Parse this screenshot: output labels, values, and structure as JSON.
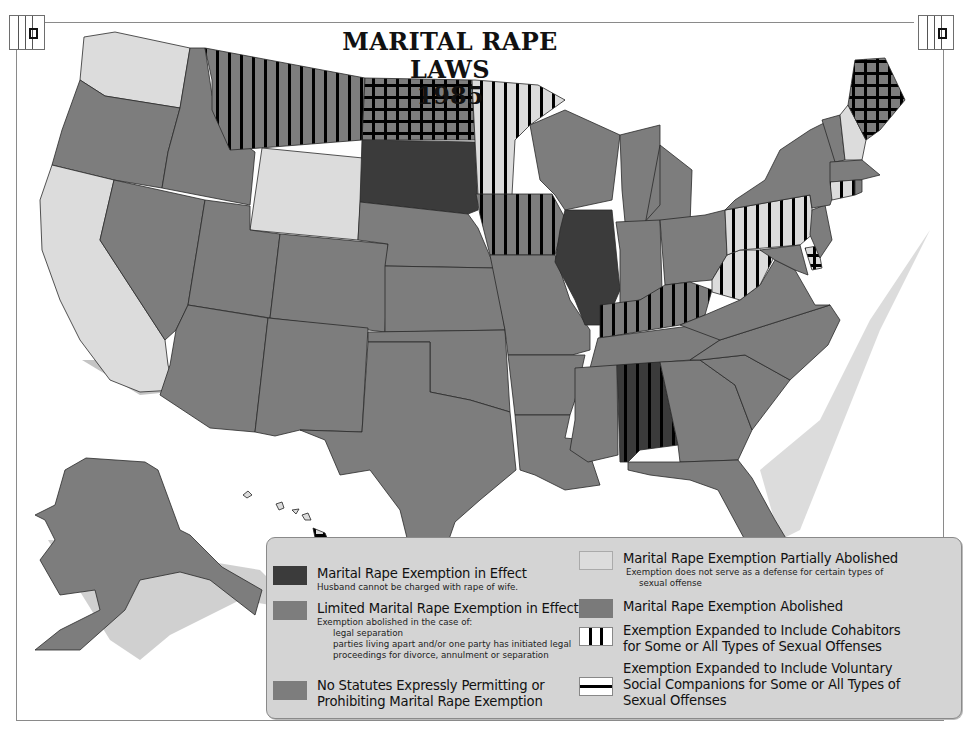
{
  "title": {
    "line1": "MARITAL RAPE LAWS",
    "line2": "1985"
  },
  "corner_icons": {
    "left": "striped-box-icon",
    "right": "striped-box-icon"
  },
  "colors": {
    "exemption_in_effect": "#3b3b3b",
    "limited_exemption": "#7d7d7d",
    "no_statutes": "#7d7d7d",
    "partially_abolished": "#dcdcdc",
    "abolished": "#7a7a7a",
    "legend_bg": "#d4d4d4",
    "shadow": "#c4c4c4",
    "hatch": "#000000"
  },
  "legend": {
    "items": [
      {
        "key": "exemption_in_effect",
        "title": "Marital Rape Exemption in Effect",
        "sub": [
          "Husband cannot be charged with rape of wife."
        ]
      },
      {
        "key": "limited_exemption",
        "title": "Limited Marital Rape Exemption in Effect",
        "sub": [
          "Exemption abolished in the case of:",
          "legal separation",
          "parties living apart and/or one party has initiated legal",
          "proceedings for divorce, annulment or separation"
        ]
      },
      {
        "key": "no_statutes",
        "title_lines": [
          "No Statutes Expressly Permitting or",
          "Prohibiting Marital Rape Exemption"
        ]
      },
      {
        "key": "partially_abolished",
        "title": "Marital Rape Exemption Partially Abolished",
        "sub": [
          "Exemption does not serve as a defense for certain types of",
          "sexual offense"
        ]
      },
      {
        "key": "abolished",
        "title": "Marital Rape Exemption Abolished"
      },
      {
        "key": "cohabitors",
        "title_lines": [
          "Exemption Expanded to Include Cohabitors",
          "for Some or All Types of Sexual Offenses"
        ]
      },
      {
        "key": "social_companions",
        "title_lines": [
          "Exemption Expanded to Include Voluntary",
          "Social Companions for Some or All Types of",
          "Sexual Offenses"
        ]
      }
    ]
  },
  "states": {
    "exemption_in_effect": [
      "South Dakota",
      "Illinois",
      "Alabama"
    ],
    "partially_abolished": [
      "Washington",
      "California",
      "Wyoming",
      "Minnesota",
      "Pennsylvania",
      "West Virginia",
      "New Hampshire",
      "Connecticut",
      "Delaware",
      "Hawaii"
    ],
    "cohabitors_overlay": [
      "Montana",
      "Minnesota",
      "Iowa",
      "Kentucky",
      "Pennsylvania",
      "West Virginia",
      "Connecticut",
      "Alabama"
    ],
    "social_companions_overlay": [
      "North Dakota",
      "Maine",
      "Delaware",
      "Hawaii"
    ]
  }
}
